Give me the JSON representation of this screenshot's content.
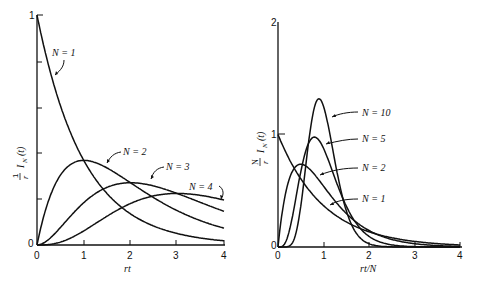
{
  "chart_data": [
    {
      "type": "line",
      "title": "",
      "xlabel": "rt",
      "ylabel": "(1/r) I_N(t)",
      "xlim": [
        0,
        4
      ],
      "ylim": [
        0,
        1
      ],
      "xticks": [
        "0",
        "1",
        "2",
        "3",
        "4"
      ],
      "yticks": [
        "0",
        "",
        "",
        "",
        "1"
      ],
      "grid": false,
      "legend": "inline labels with arrows",
      "series": [
        {
          "name": "N = 1",
          "N": 1,
          "x": [
            0,
            0.5,
            1,
            1.5,
            2,
            2.5,
            3,
            3.5,
            4
          ],
          "values": [
            1.0,
            0.61,
            0.37,
            0.22,
            0.14,
            0.08,
            0.05,
            0.03,
            0.02
          ]
        },
        {
          "name": "N = 2",
          "N": 2,
          "x": [
            0,
            0.5,
            1,
            1.5,
            2,
            2.5,
            3,
            3.5,
            4
          ],
          "values": [
            0.0,
            0.3,
            0.37,
            0.33,
            0.27,
            0.21,
            0.15,
            0.11,
            0.07
          ]
        },
        {
          "name": "N = 3",
          "N": 3,
          "x": [
            0,
            0.5,
            1,
            1.5,
            2,
            2.5,
            3,
            3.5,
            4
          ],
          "values": [
            0.0,
            0.08,
            0.18,
            0.25,
            0.27,
            0.26,
            0.22,
            0.19,
            0.15
          ]
        },
        {
          "name": "N = 4",
          "N": 4,
          "x": [
            0,
            0.5,
            1,
            1.5,
            2,
            2.5,
            3,
            3.5,
            4
          ],
          "values": [
            0.0,
            0.01,
            0.06,
            0.13,
            0.18,
            0.21,
            0.22,
            0.22,
            0.2
          ]
        }
      ]
    },
    {
      "type": "line",
      "title": "",
      "xlabel": "rt/N",
      "ylabel": "(N/r) I_N(t)",
      "xlim": [
        0,
        4
      ],
      "ylim": [
        0,
        2
      ],
      "xticks": [
        "0",
        "1",
        "2",
        "3",
        "4"
      ],
      "yticks": [
        "0",
        "1",
        "2"
      ],
      "grid": false,
      "legend": "inline labels with arrows",
      "series": [
        {
          "name": "N = 1",
          "N": 1,
          "x": [
            0,
            0.5,
            1,
            1.5,
            2,
            2.5,
            3,
            3.5,
            4
          ],
          "values": [
            1.0,
            0.61,
            0.37,
            0.22,
            0.14,
            0.08,
            0.05,
            0.03,
            0.02
          ]
        },
        {
          "name": "N = 2",
          "N": 2,
          "x": [
            0,
            0.5,
            1,
            1.5,
            2,
            2.5,
            3,
            3.5,
            4
          ],
          "values": [
            0.0,
            0.74,
            0.54,
            0.3,
            0.15,
            0.07,
            0.03,
            0.01,
            0.01
          ]
        },
        {
          "name": "N = 5",
          "N": 5,
          "x": [
            0,
            0.5,
            1,
            1.5,
            2,
            2.5,
            3,
            3.5,
            4
          ],
          "values": [
            0.0,
            0.67,
            0.88,
            0.29,
            0.05,
            0.01,
            0.0,
            0.0,
            0.0
          ]
        },
        {
          "name": "N = 10",
          "N": 10,
          "x": [
            0,
            0.5,
            1,
            1.5,
            2,
            2.5,
            3,
            3.5,
            4
          ],
          "values": [
            0.0,
            0.36,
            1.25,
            0.27,
            0.02,
            0.0,
            0.0,
            0.0,
            0.0
          ]
        }
      ]
    }
  ],
  "left": {
    "ylabel_frac": "1",
    "ylabel_den": "r",
    "ylabel_fn": "I",
    "ylabel_sub": "N",
    "ylabel_arg": "(t)",
    "xlabel": "rt",
    "y_top": "1",
    "y_zero": "0",
    "x_ticks": [
      "0",
      "1",
      "2",
      "3",
      "4"
    ],
    "labels": [
      "N = 1",
      "N = 2",
      "N = 3",
      "N = 4"
    ]
  },
  "right": {
    "ylabel_frac": "N",
    "ylabel_den": "r",
    "ylabel_fn": "I",
    "ylabel_sub": "N",
    "ylabel_arg": "(t)",
    "xlabel": "rt/N",
    "y_top": "2",
    "y_mid": "1",
    "y_zero": "0",
    "x_ticks": [
      "0",
      "1",
      "2",
      "3",
      "4"
    ],
    "labels": [
      "N = 10",
      "N = 5",
      "N = 2",
      "N = 1"
    ]
  }
}
